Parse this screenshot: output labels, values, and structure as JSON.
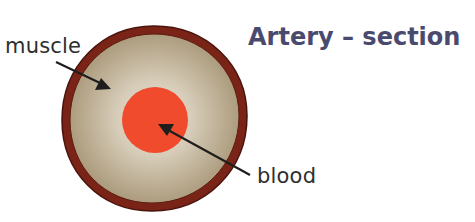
{
  "diagram": {
    "title": "Artery – section",
    "labels": {
      "muscle": "muscle",
      "blood": "blood"
    },
    "colors": {
      "outer_wall": "#7a2418",
      "outer_wall_edge": "#4a140c",
      "muscle_center": "#ece6d8",
      "muscle_edge": "#ad9c7e",
      "blood": "#ef4b2c",
      "title": "#4a4a6e",
      "arrow": "#1e1e1e"
    }
  }
}
